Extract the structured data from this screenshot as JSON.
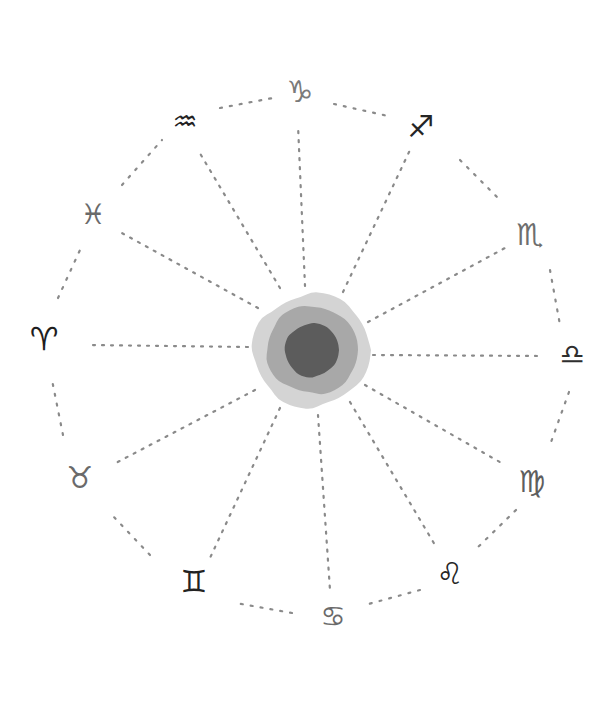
{
  "canvas": {
    "width": 597,
    "height": 712,
    "background": "#ffffff"
  },
  "center": {
    "x": 312,
    "y": 350,
    "rings": [
      {
        "name": "outer",
        "color": "#d4d4d4",
        "rx": 59,
        "ry": 57
      },
      {
        "name": "middle",
        "color": "#a8a8a8",
        "rx": 46,
        "ry": 44
      },
      {
        "name": "inner",
        "color": "#5c5c5c",
        "rx": 27,
        "ry": 27
      }
    ]
  },
  "spoke_style": {
    "color": "#8a8a8a",
    "dash": "2 7",
    "width": 2.2
  },
  "rim_style": {
    "color": "#8a8a8a",
    "dash": "2 8",
    "width": 2.2
  },
  "signs": [
    {
      "name": "capricorn",
      "glyph": "♑",
      "x": 300,
      "y": 92,
      "color": "#7a7a7a",
      "size": 30
    },
    {
      "name": "sagittarius",
      "glyph": "♐",
      "x": 421,
      "y": 127,
      "color": "#252525",
      "size": 30
    },
    {
      "name": "scorpio",
      "glyph": "♏",
      "x": 530,
      "y": 235,
      "color": "#6e6e6e",
      "size": 30
    },
    {
      "name": "libra",
      "glyph": "♎",
      "x": 572,
      "y": 355,
      "color": "#2f2f2f",
      "size": 28
    },
    {
      "name": "virgo",
      "glyph": "♍",
      "x": 532,
      "y": 482,
      "color": "#5e5e5e",
      "size": 30
    },
    {
      "name": "leo",
      "glyph": "♌",
      "x": 450,
      "y": 574,
      "color": "#262626",
      "size": 30
    },
    {
      "name": "cancer",
      "glyph": "♋",
      "x": 333,
      "y": 617,
      "color": "#6a6a6a",
      "size": 28
    },
    {
      "name": "gemini",
      "glyph": "♊",
      "x": 194,
      "y": 582,
      "color": "#222222",
      "size": 30
    },
    {
      "name": "taurus",
      "glyph": "♉",
      "x": 80,
      "y": 478,
      "color": "#6a6a6a",
      "size": 30
    },
    {
      "name": "aries",
      "glyph": "♈",
      "x": 44,
      "y": 339,
      "color": "#1e1e1e",
      "size": 32
    },
    {
      "name": "pisces",
      "glyph": "♓",
      "x": 93,
      "y": 215,
      "color": "#6a6a6a",
      "size": 28
    },
    {
      "name": "aquarius",
      "glyph": "♒",
      "x": 185,
      "y": 122,
      "color": "#222222",
      "size": 28
    }
  ],
  "spokes": [
    {
      "to": "capricorn",
      "x1": 305,
      "y1": 286,
      "x2": 298,
      "y2": 125
    },
    {
      "to": "sagittarius",
      "x1": 343,
      "y1": 292,
      "x2": 410,
      "y2": 150
    },
    {
      "to": "scorpio",
      "x1": 368,
      "y1": 322,
      "x2": 505,
      "y2": 248
    },
    {
      "to": "libra",
      "x1": 373,
      "y1": 355,
      "x2": 540,
      "y2": 356
    },
    {
      "to": "virgo",
      "x1": 365,
      "y1": 385,
      "x2": 505,
      "y2": 465
    },
    {
      "to": "leo",
      "x1": 350,
      "y1": 402,
      "x2": 435,
      "y2": 545
    },
    {
      "to": "cancer",
      "x1": 318,
      "y1": 415,
      "x2": 330,
      "y2": 590
    },
    {
      "to": "gemini",
      "x1": 280,
      "y1": 408,
      "x2": 210,
      "y2": 558
    },
    {
      "to": "taurus",
      "x1": 255,
      "y1": 390,
      "x2": 112,
      "y2": 465
    },
    {
      "to": "aries",
      "x1": 248,
      "y1": 347,
      "x2": 88,
      "y2": 345
    },
    {
      "to": "pisces",
      "x1": 258,
      "y1": 308,
      "x2": 120,
      "y2": 232
    },
    {
      "to": "aquarius",
      "x1": 280,
      "y1": 288,
      "x2": 198,
      "y2": 150
    }
  ],
  "rim_segments": [
    {
      "from": "aquarius",
      "to": "capricorn",
      "x1": 220,
      "y1": 108,
      "x2": 278,
      "y2": 97
    },
    {
      "from": "capricorn",
      "to": "sagittarius",
      "x1": 334,
      "y1": 104,
      "x2": 388,
      "y2": 116
    },
    {
      "from": "sagittarius",
      "to": "scorpio",
      "x1": 460,
      "y1": 160,
      "x2": 500,
      "y2": 200
    },
    {
      "from": "scorpio",
      "to": "libra",
      "x1": 550,
      "y1": 270,
      "x2": 560,
      "y2": 325
    },
    {
      "from": "libra",
      "to": "virgo",
      "x1": 569,
      "y1": 392,
      "x2": 550,
      "y2": 445
    },
    {
      "from": "virgo",
      "to": "leo",
      "x1": 516,
      "y1": 510,
      "x2": 475,
      "y2": 550
    },
    {
      "from": "leo",
      "to": "cancer",
      "x1": 420,
      "y1": 590,
      "x2": 365,
      "y2": 605
    },
    {
      "from": "cancer",
      "to": "gemini",
      "x1": 292,
      "y1": 613,
      "x2": 236,
      "y2": 603
    },
    {
      "from": "gemini",
      "to": "taurus",
      "x1": 150,
      "y1": 555,
      "x2": 112,
      "y2": 515
    },
    {
      "from": "taurus",
      "to": "aries",
      "x1": 63,
      "y1": 435,
      "x2": 52,
      "y2": 380
    },
    {
      "from": "aries",
      "to": "pisces",
      "x1": 58,
      "y1": 298,
      "x2": 80,
      "y2": 250
    },
    {
      "from": "pisces",
      "to": "aquarius",
      "x1": 122,
      "y1": 185,
      "x2": 162,
      "y2": 140
    }
  ]
}
